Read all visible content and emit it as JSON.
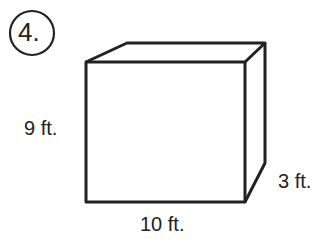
{
  "problem": {
    "number": "4."
  },
  "box": {
    "height_label": "9 ft.",
    "width_label": "10 ft.",
    "depth_label": "3 ft."
  },
  "colors": {
    "stroke": "#222222",
    "background": "#ffffff"
  }
}
